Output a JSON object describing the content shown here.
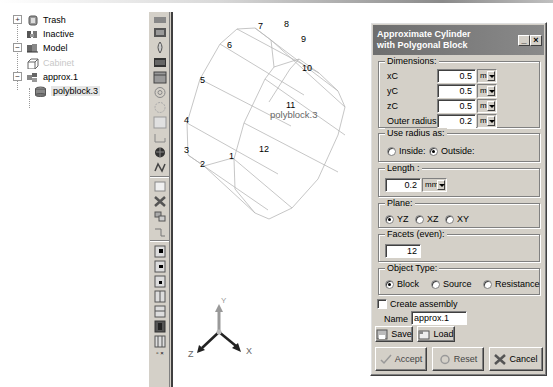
{
  "tree": {
    "items": [
      {
        "label": "Trash",
        "icon": "trash-icon",
        "expander": "+"
      },
      {
        "label": "Inactive",
        "icon": "inactive-icon"
      },
      {
        "label": "Model",
        "icon": "model-icon",
        "expander": "−"
      },
      {
        "label": "Cabinet",
        "icon": "cabinet-icon",
        "disabled": true
      },
      {
        "label": "approx.1",
        "icon": "assembly-icon",
        "expander": "−"
      },
      {
        "label": "polyblock.3",
        "icon": "polyblock-icon",
        "selected": true
      }
    ]
  },
  "toolbar": {
    "buttons": [
      "cylinder-icon",
      "block-icon",
      "source-icon",
      "plate-icon",
      "enclosure-icon",
      "fan-icon",
      "blower-icon",
      "square-icon",
      "duct-icon",
      "heatsink-icon",
      "network-icon",
      "cuboid-icon",
      "cross-icon",
      "assembly-icon",
      "region-icon",
      "grid-1-icon",
      "grid-2-icon",
      "grid-3-icon",
      "grid-4-icon",
      "grid-5-icon",
      "grid-6-icon",
      "grid-7-icon"
    ]
  },
  "viewport": {
    "object_label": "polyblock.3",
    "vertex_labels": [
      "1",
      "2",
      "3",
      "4",
      "5",
      "6",
      "7",
      "8",
      "9",
      "10",
      "11",
      "12"
    ],
    "axes": {
      "x": "X",
      "y": "Y",
      "z": "Z"
    }
  },
  "dialog": {
    "title_line1": "Approximate Cylinder",
    "title_line2": "with Polygonal Block",
    "dimensions": {
      "title": "Dimensions:",
      "xc_label": "xC",
      "xc_value": "0.5",
      "xc_unit": "m",
      "yc_label": "yC",
      "yc_value": "0.5",
      "yc_unit": "m",
      "zc_label": "zC",
      "zc_value": "0.5",
      "zc_unit": "m",
      "radius_label": "Outer radius:",
      "radius_value": "0.2",
      "radius_unit": "m"
    },
    "radius_mode": {
      "title": "Use radius as:",
      "inside": "Inside:",
      "outside": "Outside:",
      "selected": "outside"
    },
    "length": {
      "title": "Length :",
      "value": "0.2",
      "unit": "mm"
    },
    "plane": {
      "title": "Plane:",
      "options": [
        "YZ",
        "XZ",
        "XY"
      ],
      "selected": "YZ"
    },
    "facets": {
      "title": "Facets (even):",
      "value": "12"
    },
    "object_type": {
      "title": "Object Type:",
      "options": [
        "Block",
        "Source",
        "Resistance"
      ],
      "selected": "Block"
    },
    "create_assembly": {
      "label": "Create assembly",
      "checked": false
    },
    "name": {
      "label": "Name",
      "value": "approx.1"
    },
    "save_label": "Save",
    "load_label": "Load",
    "accept_label": "Accept",
    "reset_label": "Reset",
    "cancel_label": "Cancel"
  }
}
